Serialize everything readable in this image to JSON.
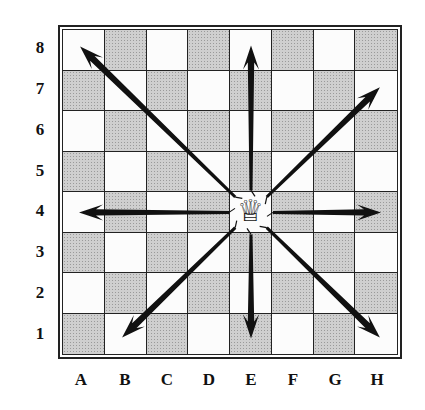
{
  "diagram": {
    "ranks": [
      "8",
      "7",
      "6",
      "5",
      "4",
      "3",
      "2",
      "1"
    ],
    "files": [
      "A",
      "B",
      "C",
      "D",
      "E",
      "F",
      "G",
      "H"
    ],
    "piece": {
      "name": "queen",
      "square": "E4",
      "glyph": "♕"
    },
    "moves": [
      {
        "direction": "up-left",
        "to": "A8"
      },
      {
        "direction": "up",
        "to": "E8"
      },
      {
        "direction": "up-right",
        "to": "H7"
      },
      {
        "direction": "left",
        "to": "A4"
      },
      {
        "direction": "right",
        "to": "H4"
      },
      {
        "direction": "down-left",
        "to": "B1"
      },
      {
        "direction": "down",
        "to": "E1"
      },
      {
        "direction": "down-right",
        "to": "H1"
      }
    ],
    "colors": {
      "light": "#fcfcfc",
      "dark": "#cfcfcf",
      "line": "#222222",
      "arrow": "#111111"
    }
  }
}
